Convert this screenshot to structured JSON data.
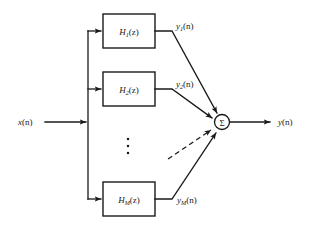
{
  "diagram": {
    "colors": {
      "stroke": "#1a1a1a",
      "background": "#ffffff"
    },
    "input": {
      "label_base": "x",
      "label_arg": "(n)",
      "label_full": "x(n)"
    },
    "output": {
      "label_base": "y",
      "label_arg": "(n)",
      "label_full": "y(n)"
    },
    "summation": {
      "glyph": "Σ",
      "name": "summation-node"
    },
    "ellipsis": {
      "glyph": "⋮",
      "dot_count": 3
    },
    "branches": [
      {
        "id": "branch-1",
        "block_base": "H",
        "block_sub": "1",
        "block_arg": "(z)",
        "block_label_full": "H1(z)",
        "signal_base": "y",
        "signal_sub": "1",
        "signal_arg": "(n)",
        "signal_label_full": "y1(n)"
      },
      {
        "id": "branch-2",
        "block_base": "H",
        "block_sub": "2",
        "block_arg": "(z)",
        "block_label_full": "H2(z)",
        "signal_base": "y",
        "signal_sub": "2",
        "signal_arg": "(n)",
        "signal_label_full": "y2(n)"
      },
      {
        "id": "branch-m",
        "block_base": "H",
        "block_sub": "M",
        "block_arg": "(z)",
        "block_label_full": "HM(z)",
        "signal_base": "y",
        "signal_sub": "M",
        "signal_arg": "(n)",
        "signal_label_full": "yM(n)"
      }
    ]
  }
}
